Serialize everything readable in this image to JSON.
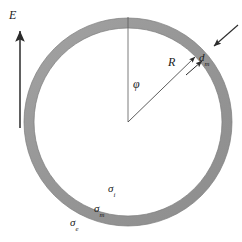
{
  "figure": {
    "colors": {
      "ring_fill": "#9a9a9a",
      "ring_edge": "#6f6f6f",
      "line": "#2b2b2b",
      "thin_line": "#5a5a5a",
      "background": "#ffffff",
      "text": "#1a1a1a"
    },
    "geometry": {
      "center_x": 128,
      "center_y": 122,
      "outer_radius": 104,
      "inner_radius": 94,
      "ring_thickness": 10,
      "radius_arrow_angle_deg": 45
    }
  },
  "labels": {
    "field": {
      "symbol": "E",
      "name": "electric-field"
    },
    "radius": {
      "symbol": "R",
      "name": "radius"
    },
    "thickness": {
      "symbol": "d",
      "subscript": "m",
      "name": "ring-thickness"
    },
    "angle": {
      "symbol": "φ",
      "name": "angular-coordinate"
    },
    "stress_inner": {
      "symbol": "σ",
      "subscript": "i",
      "name": "inner-stress"
    },
    "stress_mid": {
      "symbol": "σ",
      "subscript": "m",
      "name": "mid-stress"
    },
    "stress_outer": {
      "symbol": "σ",
      "subscript": "e",
      "name": "outer-stress"
    }
  },
  "annotations": {
    "field_arrow": {
      "x": 20,
      "y_tail": 128,
      "y_head": 28,
      "direction": "up"
    },
    "radius_arrow": {
      "x_tail": 128,
      "y_tail": 122,
      "x_head": 198,
      "y_head": 54
    },
    "reference_line": {
      "x": 128,
      "y_top": 17,
      "y_bottom": 122
    },
    "thickness_arrow": {
      "x_tail": 237,
      "y_tail": 26,
      "x_head": 213,
      "y_head": 47
    },
    "thickness_leader": {
      "x_tail": 186,
      "y_tail": 74,
      "x_head": 203,
      "y_head": 60
    }
  }
}
